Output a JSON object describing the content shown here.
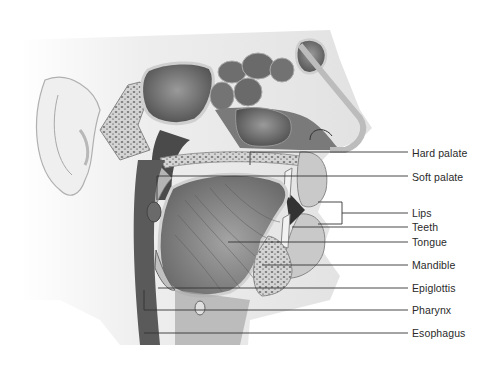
{
  "figure": {
    "style": "grayscale medical illustration",
    "colors": {
      "background": "#ffffff",
      "tissue_dark": "#5a5a5a",
      "tissue_mid": "#8c8c8c",
      "tissue_light": "#c8c8c8",
      "skin": "#d9d9d9",
      "leader_line": "#333333",
      "label_text": "#2a2a2a"
    }
  },
  "labels": [
    {
      "id": "hard-palate",
      "text": "Hard palate",
      "x": 412,
      "y": 147
    },
    {
      "id": "soft-palate",
      "text": "Soft palate",
      "x": 412,
      "y": 171
    },
    {
      "id": "lips",
      "text": "Lips",
      "x": 412,
      "y": 212
    },
    {
      "id": "teeth",
      "text": "Teeth",
      "x": 412,
      "y": 226
    },
    {
      "id": "tongue",
      "text": "Tongue",
      "x": 412,
      "y": 241
    },
    {
      "id": "mandible",
      "text": "Mandible",
      "x": 412,
      "y": 264
    },
    {
      "id": "epiglottis",
      "text": "Epiglottis",
      "x": 412,
      "y": 287
    },
    {
      "id": "pharynx",
      "text": "Pharynx",
      "x": 412,
      "y": 309
    },
    {
      "id": "esophagus",
      "text": "Esophagus",
      "x": 412,
      "y": 332
    }
  ]
}
